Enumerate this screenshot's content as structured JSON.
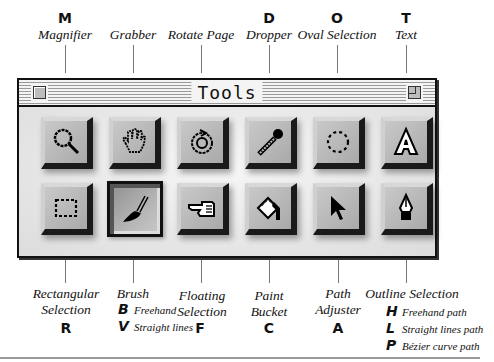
{
  "window": {
    "title": "Tools"
  },
  "top_tools": [
    {
      "key": "M",
      "name": "Magnifier",
      "icon": "magnifier-icon"
    },
    {
      "key": "",
      "name": "Grabber",
      "icon": "hand-icon"
    },
    {
      "key": "",
      "name": "Rotate Page",
      "icon": "rotate-icon"
    },
    {
      "key": "D",
      "name": "Dropper",
      "icon": "dropper-icon"
    },
    {
      "key": "O",
      "name": "Oval Selection",
      "icon": "oval-selection-icon"
    },
    {
      "key": "T",
      "name": "Text",
      "icon": "text-icon"
    }
  ],
  "bottom_tools": [
    {
      "key": "R",
      "name_line1": "Rectangular",
      "name_line2": "Selection",
      "icon": "rectangle-selection-icon"
    },
    {
      "key": "",
      "name_line1": "Brush",
      "name_line2": "",
      "icon": "brush-icon",
      "selected": true,
      "modes": [
        {
          "key": "B",
          "label": "Freehand"
        },
        {
          "key": "V",
          "label": "Straight lines"
        }
      ]
    },
    {
      "key": "F",
      "name_line1": "Floating",
      "name_line2": "Selection",
      "icon": "pointing-hand-icon"
    },
    {
      "key": "C",
      "name_line1": "Paint",
      "name_line2": "Bucket",
      "icon": "paint-bucket-icon"
    },
    {
      "key": "A",
      "name_line1": "Path",
      "name_line2": "Adjuster",
      "icon": "arrow-pointer-icon"
    },
    {
      "key": "",
      "name_line1": "Outline Selection",
      "name_line2": "",
      "icon": "pen-nib-icon",
      "modes": [
        {
          "key": "H",
          "label": "Freehand path"
        },
        {
          "key": "L",
          "label": "Straight lines path"
        },
        {
          "key": "P",
          "label": "Bézier curve path"
        }
      ]
    }
  ]
}
